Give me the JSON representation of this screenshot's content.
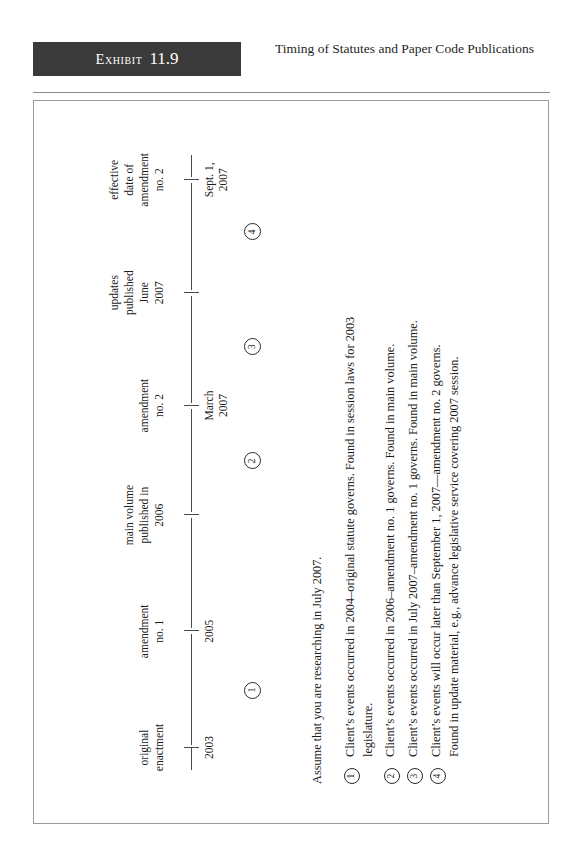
{
  "header": {
    "exhibit_word": "Exhibit",
    "exhibit_number": "11.9",
    "title": "Timing of Statutes and Paper Code Publications"
  },
  "chart_data": {
    "type": "timeline",
    "title": "Timing of Statutes and Paper Code Publications",
    "orientation": "rotated-90-ccw",
    "axis_label": "",
    "events": [
      {
        "label": "original enactment",
        "label_line1": "original",
        "label_line2": "enactment",
        "date_line1": "2003",
        "date_line2": "",
        "x": 0.07
      },
      {
        "label": "amendment no. 1",
        "label_line1": "amendment",
        "label_line2": "no. 1",
        "date_line1": "2005",
        "date_line2": "",
        "x": 0.245
      },
      {
        "label": "main volume published in 2006",
        "label_line1": "main volume",
        "label_line2": "published in",
        "label_line3": "2006",
        "date_line1": "",
        "date_line2": "",
        "x": 0.42
      },
      {
        "label": "amendment no. 2",
        "label_line1": "amendment",
        "label_line2": "no. 2",
        "date_line1": "March",
        "date_line2": "2007",
        "x": 0.585
      },
      {
        "label": "updates published June 2007",
        "label_line1": "updates",
        "label_line2": "published",
        "label_line3": "June",
        "label_line4": "2007",
        "date_line1": "",
        "date_line2": "",
        "x": 0.755
      },
      {
        "label": "effective date of amendment no. 2",
        "label_line1": "effective",
        "label_line2": "date of",
        "label_line3": "amendment",
        "label_line4": "no. 2",
        "date_line1": "Sept. 1,",
        "date_line2": "2007",
        "x": 0.925
      }
    ],
    "markers": [
      {
        "number": "1",
        "glyph": "①",
        "x": 0.155
      },
      {
        "number": "2",
        "glyph": "②",
        "x": 0.5
      },
      {
        "number": "3",
        "glyph": "③",
        "x": 0.672
      },
      {
        "number": "4",
        "glyph": "④",
        "x": 0.845
      }
    ]
  },
  "legend": {
    "intro": "Assume that you are researching in July 2007.",
    "items": [
      {
        "glyph": "①",
        "number": "1",
        "line1": "Client’s events occurred in 2004–original statute governs.  Found in session laws for 2003",
        "line2": "legislature."
      },
      {
        "glyph": "②",
        "number": "2",
        "line1": "Client’s events occurred in 2006–amendment no. 1 governs.  Found in main volume.",
        "line2": ""
      },
      {
        "glyph": "③",
        "number": "3",
        "line1": "Client’s events occurred in July 2007–amendment no. 1 governs.  Found in main volume.",
        "line2": ""
      },
      {
        "glyph": "④",
        "number": "4",
        "line1": "Client’s events will occur later than September 1, 2007—amendment no. 2 governs.",
        "line2": "Found in update material, e.g., advance legislative service covering 2007 session."
      }
    ]
  }
}
